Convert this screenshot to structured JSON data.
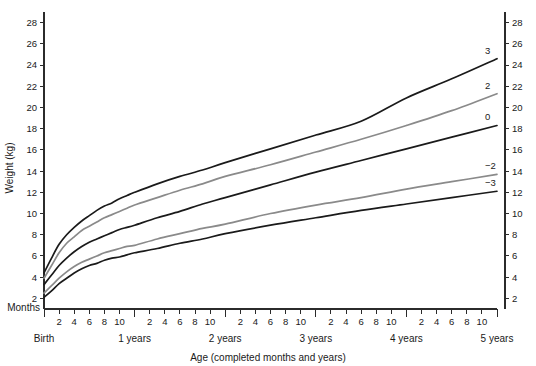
{
  "chart_data": {
    "type": "line",
    "title": "",
    "xlabel": "Age (completed months and years)",
    "ylabel": "Weight (kg)",
    "xlim": [
      0,
      60
    ],
    "ylim": [
      1,
      29
    ],
    "grid": false,
    "legend_position": "inline-right-curve-labels",
    "x_unit": "months",
    "months_axis_label": "Months",
    "y_ticks": [
      2,
      4,
      6,
      8,
      10,
      12,
      14,
      16,
      18,
      20,
      22,
      24,
      26,
      28
    ],
    "y_ticks_right": [
      2,
      4,
      6,
      8,
      10,
      12,
      14,
      16,
      18,
      20,
      22,
      24,
      26,
      28
    ],
    "x_month_ticks": [
      2,
      4,
      6,
      8,
      10
    ],
    "x_year_labels": [
      "Birth",
      "1 years",
      "2 years",
      "3 years",
      "4 years",
      "5 years"
    ],
    "x_year_positions": [
      0,
      12,
      24,
      36,
      48,
      60
    ],
    "series": [
      {
        "name": "3",
        "label": "3",
        "color": "#1a1a1a",
        "x": [
          0,
          1,
          2,
          3,
          4,
          5,
          6,
          7,
          8,
          9,
          10,
          11,
          12,
          15,
          18,
          21,
          24,
          30,
          36,
          42,
          48,
          54,
          60
        ],
        "values": [
          4.4,
          5.8,
          7.1,
          8.0,
          8.7,
          9.3,
          9.8,
          10.3,
          10.7,
          11.0,
          11.4,
          11.7,
          12.0,
          12.8,
          13.5,
          14.1,
          14.8,
          16.1,
          17.4,
          18.7,
          20.9,
          22.7,
          24.6
        ]
      },
      {
        "name": "2",
        "label": "2",
        "color": "#8a8a8a",
        "x": [
          0,
          1,
          2,
          3,
          4,
          5,
          6,
          7,
          8,
          9,
          10,
          11,
          12,
          15,
          18,
          21,
          24,
          30,
          36,
          42,
          48,
          54,
          60
        ],
        "values": [
          3.9,
          5.1,
          6.3,
          7.2,
          7.8,
          8.4,
          8.8,
          9.2,
          9.6,
          9.9,
          10.2,
          10.5,
          10.8,
          11.5,
          12.2,
          12.8,
          13.5,
          14.6,
          15.8,
          17.0,
          18.3,
          19.7,
          21.3
        ]
      },
      {
        "name": "0",
        "label": "0",
        "color": "#1a1a1a",
        "x": [
          0,
          1,
          2,
          3,
          4,
          5,
          6,
          7,
          8,
          9,
          10,
          11,
          12,
          15,
          18,
          21,
          24,
          30,
          36,
          42,
          48,
          54,
          60
        ],
        "values": [
          3.3,
          4.2,
          5.1,
          5.8,
          6.4,
          6.9,
          7.3,
          7.6,
          7.9,
          8.2,
          8.5,
          8.7,
          8.9,
          9.6,
          10.2,
          10.9,
          11.5,
          12.7,
          13.9,
          15.0,
          16.1,
          17.2,
          18.3
        ]
      },
      {
        "name": "-2",
        "label": "−2",
        "color": "#8a8a8a",
        "x": [
          0,
          1,
          2,
          3,
          4,
          5,
          6,
          7,
          8,
          9,
          10,
          11,
          12,
          15,
          18,
          21,
          24,
          30,
          36,
          42,
          48,
          54,
          60
        ],
        "values": [
          2.5,
          3.2,
          3.9,
          4.5,
          5.0,
          5.4,
          5.7,
          6.0,
          6.3,
          6.5,
          6.7,
          6.9,
          7.0,
          7.6,
          8.1,
          8.6,
          9.0,
          10.0,
          10.8,
          11.5,
          12.3,
          13.0,
          13.7
        ]
      },
      {
        "name": "-3",
        "label": "−3",
        "color": "#1a1a1a",
        "x": [
          0,
          1,
          2,
          3,
          4,
          5,
          6,
          7,
          8,
          9,
          10,
          11,
          12,
          15,
          18,
          21,
          24,
          30,
          36,
          42,
          48,
          54,
          60
        ],
        "values": [
          2.1,
          2.7,
          3.4,
          3.9,
          4.4,
          4.8,
          5.1,
          5.3,
          5.6,
          5.8,
          5.9,
          6.1,
          6.3,
          6.7,
          7.2,
          7.6,
          8.1,
          8.9,
          9.6,
          10.3,
          10.9,
          11.5,
          12.1
        ]
      }
    ]
  }
}
